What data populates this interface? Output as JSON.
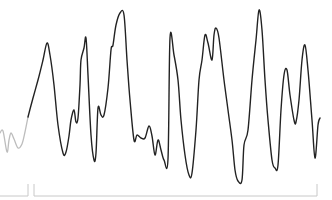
{
  "chart_data": {
    "type": "line",
    "title": "",
    "xlabel": "",
    "ylabel": "",
    "grid": false,
    "legend": null,
    "series": [
      {
        "name": "pre-segment",
        "color": "#bdbdbd",
        "points": [
          [
            0,
            133
          ],
          [
            3,
            131
          ],
          [
            7,
            152
          ],
          [
            9,
            140
          ],
          [
            11,
            133
          ],
          [
            14,
            139
          ],
          [
            18,
            148
          ],
          [
            22,
            144
          ],
          [
            25,
            132
          ],
          [
            28,
            117
          ]
        ]
      },
      {
        "name": "main-segment",
        "color": "#222222",
        "points": [
          [
            28,
            117
          ],
          [
            33,
            98
          ],
          [
            38,
            80
          ],
          [
            43,
            60
          ],
          [
            47,
            43
          ],
          [
            50,
            55
          ],
          [
            54,
            85
          ],
          [
            58,
            125
          ],
          [
            63,
            153
          ],
          [
            66,
            152
          ],
          [
            69,
            136
          ],
          [
            71,
            120
          ],
          [
            74,
            110
          ],
          [
            76,
            122
          ],
          [
            78,
            118
          ],
          [
            80,
            85
          ],
          [
            81,
            60
          ],
          [
            84,
            48
          ],
          [
            86,
            38
          ],
          [
            88,
            75
          ],
          [
            91,
            135
          ],
          [
            94,
            160
          ],
          [
            96,
            153
          ],
          [
            98,
            108
          ],
          [
            101,
            115
          ],
          [
            104,
            115
          ],
          [
            108,
            88
          ],
          [
            111,
            50
          ],
          [
            113,
            45
          ],
          [
            116,
            25
          ],
          [
            120,
            13
          ],
          [
            124,
            15
          ],
          [
            127,
            60
          ],
          [
            130,
            100
          ],
          [
            134,
            140
          ],
          [
            137,
            135
          ],
          [
            141,
            138
          ],
          [
            145,
            138
          ],
          [
            149,
            126
          ],
          [
            152,
            136
          ],
          [
            155,
            155
          ],
          [
            158,
            140
          ],
          [
            161,
            150
          ],
          [
            164,
            160
          ],
          [
            168,
            159
          ],
          [
            170,
            38
          ],
          [
            174,
            55
          ],
          [
            178,
            80
          ],
          [
            181,
            120
          ],
          [
            185,
            155
          ],
          [
            189,
            175
          ],
          [
            192,
            173
          ],
          [
            196,
            130
          ],
          [
            199,
            80
          ],
          [
            202,
            60
          ],
          [
            205,
            35
          ],
          [
            208,
            43
          ],
          [
            212,
            60
          ],
          [
            214,
            35
          ],
          [
            216,
            28
          ],
          [
            219,
            38
          ],
          [
            224,
            80
          ],
          [
            228,
            110
          ],
          [
            232,
            140
          ],
          [
            235,
            170
          ],
          [
            238,
            181
          ],
          [
            242,
            180
          ],
          [
            244,
            145
          ],
          [
            248,
            130
          ],
          [
            252,
            80
          ],
          [
            256,
            40
          ],
          [
            259,
            10
          ],
          [
            262,
            30
          ],
          [
            265,
            80
          ],
          [
            268,
            120
          ],
          [
            272,
            160
          ],
          [
            275,
            168
          ],
          [
            278,
            165
          ],
          [
            281,
            110
          ],
          [
            284,
            75
          ],
          [
            287,
            70
          ],
          [
            290,
            95
          ],
          [
            294,
            120
          ],
          [
            296,
            122
          ],
          [
            299,
            100
          ],
          [
            302,
            60
          ],
          [
            305,
            45
          ],
          [
            308,
            70
          ],
          [
            312,
            120
          ],
          [
            315,
            158
          ],
          [
            318,
            125
          ],
          [
            320,
            118
          ]
        ]
      }
    ],
    "markers": [
      {
        "name": "segment-bracket-left",
        "x_start": 0,
        "x_end": 28,
        "y": 196
      },
      {
        "name": "segment-bracket-right",
        "x_start": 34,
        "x_end": 317,
        "y": 196
      }
    ]
  }
}
